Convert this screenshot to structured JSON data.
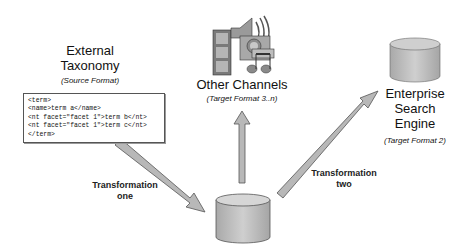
{
  "source": {
    "title_line1": "External",
    "title_line2": "Taxonomy",
    "subtitle": "(Source Format)",
    "code_lines": [
      "<term>",
      "<name>term a</name>",
      "<nt facet=\"facet 1\">term b</nt>",
      "<nt facet=\"facet 1\">term c</nt>",
      "</term>"
    ]
  },
  "other_channels": {
    "title": "Other Channels",
    "subtitle": "(Target Format 3..n)"
  },
  "enterprise_search": {
    "title_line1": "Enterprise",
    "title_line2": "Search",
    "title_line3": "Engine",
    "subtitle": "(Target Format 2)"
  },
  "transformations": {
    "one_line1": "Transformation",
    "one_line2": "one",
    "two_line1": "Transformation",
    "two_line2": "two"
  },
  "colors": {
    "arrow_fill": "#b8b8b8",
    "arrow_stroke": "#555555",
    "db_fill": "#bdbdbd"
  }
}
